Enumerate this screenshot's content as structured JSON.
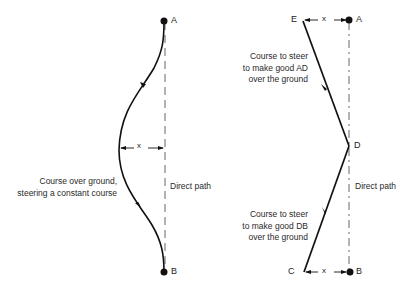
{
  "left_diagram": {
    "points": {
      "start": "A",
      "end": "B"
    },
    "offset_label": "x",
    "curve_label": [
      "Course over ground,",
      "steering a constant course"
    ],
    "direct_path_label": "Direct path"
  },
  "right_diagram": {
    "points": {
      "top_right": "A",
      "top_left": "E",
      "middle": "D",
      "bottom_left": "C",
      "bottom_right": "B"
    },
    "top_offset_label": "x",
    "bottom_offset_label": "x",
    "upper_leg_label": [
      "Course to steer",
      "to make good AD",
      "over the ground"
    ],
    "lower_leg_label": [
      "Course to steer",
      "to make good DB",
      "over the ground"
    ],
    "direct_path_label": "Direct path"
  },
  "colors": {
    "line": "#111111",
    "dashed": "#555555",
    "text": "#2a2a2a"
  }
}
